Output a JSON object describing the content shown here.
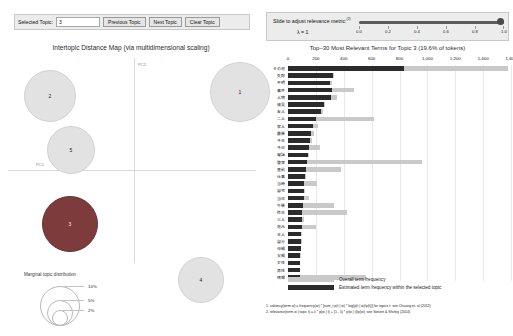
{
  "left": {
    "toolbar": {
      "selected_topic_label": "Selected Topic:",
      "selected_topic_value": "3",
      "previous_label": "Previous Topic",
      "next_label": "Next Topic",
      "clear_label": "Clear Topic"
    },
    "title": "Intertopic Distance Map (via multidimensional scaling)",
    "axes": {
      "x_label": "PC1",
      "y_label": "PC2"
    },
    "bubbles": [
      {
        "id": "1",
        "label": "1",
        "cx": 232,
        "cy": 34,
        "r": 30,
        "selected": false
      },
      {
        "id": "2",
        "label": "2",
        "cx": 42,
        "cy": 38,
        "r": 26,
        "selected": false
      },
      {
        "id": "5",
        "label": "5",
        "cx": 63,
        "cy": 92,
        "r": 24,
        "selected": false
      },
      {
        "id": "3",
        "label": "3",
        "cx": 62,
        "cy": 166,
        "r": 28,
        "selected": true
      },
      {
        "id": "4",
        "label": "4",
        "cx": 193,
        "cy": 222,
        "r": 23,
        "selected": false
      }
    ],
    "marginal_legend": {
      "title": "Marginal topic distribution",
      "entries": [
        {
          "label": "2%",
          "r": 8
        },
        {
          "label": "5%",
          "r": 13
        },
        {
          "label": "10%",
          "r": 20
        }
      ]
    }
  },
  "right": {
    "relevance": {
      "label": "Slide to adjust relevance metric:",
      "superscript": "(2)",
      "lambda_text": "λ = 1",
      "value": 1.0,
      "ticks": [
        "0.0",
        "0.2",
        "0.4",
        "0.6",
        "0.8",
        "1.0"
      ]
    },
    "bars_title": "Top–30 Most Relevant Terms for Topic 3 (19.6% of tokens)",
    "legend": [
      {
        "key": "overall",
        "label": "Overall term frequency",
        "color": "#c9c9c9"
      },
      {
        "key": "topic",
        "label": "Estimated term frequency within the selected topic",
        "color": "#2b2b2b"
      }
    ],
    "footnotes": [
      "1. saliency(term w) = frequency(w) * [sum_t p(t | w) * log(p(t | w)/p(t))] for topics t; see Chuang et. al (2012)",
      "2. relevance(term w | topic t) = λ * p(w | t) + (1 - λ) * p(w | t)/p(w); see Sievert & Shirley (2014)"
    ]
  },
  "chart_data": {
    "type": "bar",
    "title": "Top–30 Most Relevant Terms for Topic 3 (19.6% of tokens)",
    "xlabel": "",
    "ylabel": "",
    "xlim": [
      0,
      1600
    ],
    "xticks": [
      0,
      200,
      400,
      600,
      800,
      1000,
      1200,
      1400,
      1600
    ],
    "xticklabels": [
      "0",
      "200",
      "400",
      "600",
      "800",
      "1,000",
      "1,200",
      "1,400",
      "1,600"
    ],
    "grid": true,
    "legend_position": "bottom-left",
    "orientation": "horizontal",
    "categories": [
      "その他",
      "失踪",
      "不明",
      "事件",
      "人物",
      "発見",
      "友人",
      "二人",
      "家人",
      "最後",
      "今年",
      "今日",
      "電話",
      "警察",
      "直前",
      "仕事",
      "当時",
      "自宅",
      "当日",
      "午後",
      "昨年",
      "三人",
      "地元",
      "本人",
      "自分",
      "母親",
      "父親",
      "女性",
      "男性",
      "情報"
    ],
    "series": [
      {
        "name": "Overall term frequency",
        "color": "#c9c9c9",
        "values": [
          1580,
          330,
          318,
          470,
          352,
          268,
          250,
          620,
          215,
          190,
          175,
          232,
          148,
          965,
          380,
          132,
          210,
          122,
          148,
          330,
          425,
          112,
          200,
          104,
          98,
          94,
          90,
          88,
          84,
          560
        ]
      },
      {
        "name": "Estimated term frequency within the selected topic",
        "color": "#2b2b2b",
        "values": [
          835,
          320,
          300,
          318,
          305,
          258,
          240,
          198,
          178,
          168,
          160,
          148,
          140,
          133,
          126,
          120,
          118,
          115,
          112,
          108,
          104,
          100,
          97,
          95,
          93,
          91,
          89,
          87,
          85,
          83
        ]
      }
    ]
  }
}
